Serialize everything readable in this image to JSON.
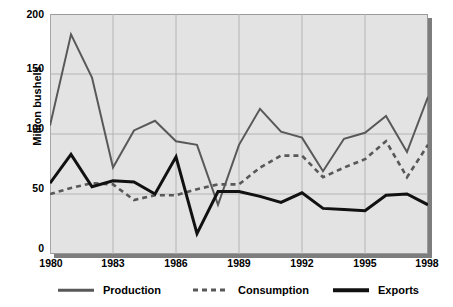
{
  "chart_data": {
    "type": "line",
    "title": "",
    "xlabel": "",
    "ylabel": "Million bushels",
    "ylim": [
      0,
      200
    ],
    "yticks": [
      0,
      50,
      100,
      150,
      200
    ],
    "xlim": [
      1980,
      1998
    ],
    "xticks": [
      1980,
      1983,
      1986,
      1989,
      1992,
      1995,
      1998
    ],
    "x": [
      1980,
      1981,
      1982,
      1983,
      1984,
      1985,
      1986,
      1987,
      1988,
      1989,
      1990,
      1991,
      1992,
      1993,
      1994,
      1995,
      1996,
      1997,
      1998
    ],
    "grid": true,
    "legend_position": "bottom",
    "series": [
      {
        "name": "Production",
        "style": "solid",
        "color": "#585858",
        "values": [
          107,
          183,
          147,
          72,
          103,
          111,
          94,
          91,
          41,
          91,
          121,
          102,
          97,
          69,
          96,
          101,
          115,
          85,
          131
        ]
      },
      {
        "name": "Consumption",
        "style": "dashed",
        "color": "#585858",
        "values": [
          50,
          55,
          59,
          58,
          45,
          49,
          49,
          54,
          58,
          58,
          72,
          82,
          82,
          64,
          72,
          79,
          94,
          64,
          91
        ]
      },
      {
        "name": "Exports",
        "style": "solid-thick",
        "color": "#111111",
        "values": [
          59,
          83,
          56,
          61,
          60,
          50,
          81,
          17,
          52,
          52,
          48,
          43,
          51,
          38,
          37,
          36,
          49,
          50,
          41
        ]
      }
    ]
  },
  "axis": {
    "y_tick_labels": [
      "200",
      "150",
      "100",
      "50",
      "0"
    ],
    "x_tick_labels": [
      "1980",
      "1983",
      "1986",
      "1989",
      "1992",
      "1995",
      "1998"
    ],
    "y_axis_title": "Million bushels"
  },
  "legend": {
    "items": [
      {
        "label": "Production",
        "swatch": "line-solid-gray-icon"
      },
      {
        "label": "Consumption",
        "swatch": "line-dashed-gray-icon"
      },
      {
        "label": "Exports",
        "swatch": "line-solid-black-icon"
      }
    ]
  },
  "colors": {
    "plot_background": "#e3e3e3",
    "grid": "#b4b4b4",
    "frame": "#9a9a9a",
    "shadow": "#7d7d7d",
    "production": "#585858",
    "consumption": "#585858",
    "exports": "#111111"
  }
}
